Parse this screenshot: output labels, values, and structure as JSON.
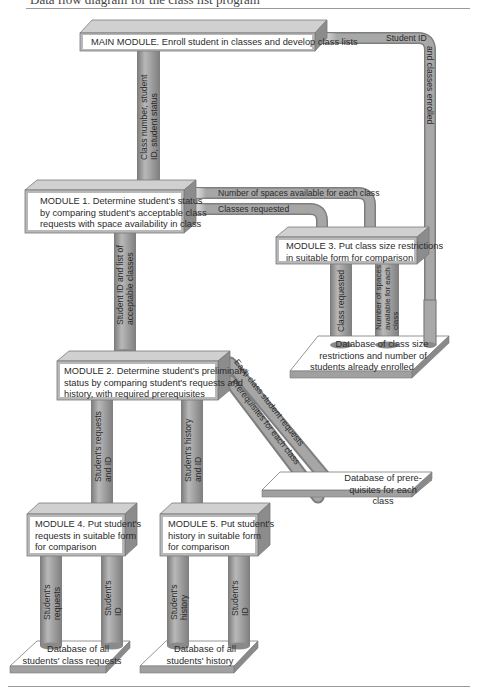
{
  "caption": "Data flow diagram for the class list program",
  "colors": {
    "module_face": "#ffffff",
    "module_frame": "#b4b4b4",
    "module_top": "#d6d6d6",
    "module_side": "#8a8a8a",
    "pipe": "#a3a3a3",
    "pipe_dark": "#7e7e7e",
    "db_top": "#ffffff",
    "db_edge": "#9a9a9a"
  },
  "modules": {
    "main": "MAIN MODULE. Enroll student in classes and develop class lists",
    "m1": [
      "MODULE 1. Determine student's status",
      "by comparing student's acceptable class",
      "requests with space availability in class"
    ],
    "m2": [
      "MODULE 2. Determine student's preliminary",
      "status by comparing student's requests and",
      "history, with required prerequisites"
    ],
    "m3": [
      "MODULE 3. Put class size restrictions",
      "in suitable form for comparison"
    ],
    "m4": [
      "MODULE 4. Put student's",
      "requests in suitable form",
      "for comparison"
    ],
    "m5": [
      "MODULE 5. Put student's",
      "history in suitable form",
      "for comparison"
    ]
  },
  "databases": {
    "class_size": [
      "Database of class size",
      "restrictions and number of",
      "students already enrolled"
    ],
    "prereq": [
      "Database of prere-",
      "quisites for each class"
    ],
    "requests": [
      "Database of all",
      "students' class requests"
    ],
    "history": [
      "Database of all",
      "students' history"
    ]
  },
  "flows": {
    "main_to_m1": [
      "Class number, student",
      "ID, student status"
    ],
    "student_id": "Student ID",
    "classes_enrolled": "and classes enrolled",
    "spaces_available": "Number of spaces available for each class",
    "classes_requested": "Classes requested",
    "m1_to_m2": [
      "Student ID and list of",
      "acceptable classes"
    ],
    "m3_class_requested": "Class requested",
    "m3_spaces": [
      "Number of spaces",
      "available for each",
      "class"
    ],
    "each_class_requests": "Each class student requests",
    "prereq_each_class": "Prerequisites for each class",
    "m2_to_m4": [
      "Student's requests",
      "and ID"
    ],
    "m2_to_m5": [
      "Student's history",
      "and ID"
    ],
    "m4_requests": [
      "Student's",
      "requests"
    ],
    "m4_id": [
      "Student's",
      "ID"
    ],
    "m5_history": [
      "Student's",
      "history"
    ],
    "m5_id": [
      "Student's",
      "ID"
    ]
  }
}
